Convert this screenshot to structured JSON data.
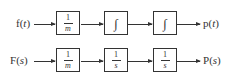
{
  "diagram": {
    "rows": [
      {
        "name": "time-domain",
        "input": {
          "fn": "f",
          "var": "t"
        },
        "blocks": [
          {
            "type": "fraction",
            "num": "1",
            "den": "m"
          },
          {
            "type": "integral",
            "symbol": "∫"
          },
          {
            "type": "integral",
            "symbol": "∫"
          }
        ],
        "output": {
          "fn": "p",
          "var": "t"
        }
      },
      {
        "name": "laplace-domain",
        "input": {
          "fn": "F",
          "var": "s"
        },
        "blocks": [
          {
            "type": "fraction",
            "num": "1",
            "den": "m"
          },
          {
            "type": "fraction",
            "num": "1",
            "den": "s"
          },
          {
            "type": "fraction",
            "num": "1",
            "den": "s"
          }
        ],
        "output": {
          "fn": "P",
          "var": "s"
        }
      }
    ]
  }
}
